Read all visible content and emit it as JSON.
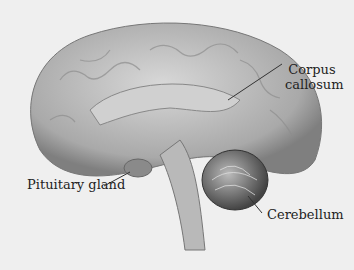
{
  "diagram": {
    "labels": {
      "corpus_callosum_line1": "Corpus",
      "corpus_callosum_line2": "callosum",
      "pituitary_gland": "Pituitary gland",
      "cerebellum": "Cerebellum"
    },
    "colors": {
      "background": "#efefef",
      "brain_fill": "#bdbdbd",
      "brain_dark": "#8a8a8a",
      "cerebellum_dark": "#555555",
      "leader_line": "#333333"
    }
  }
}
